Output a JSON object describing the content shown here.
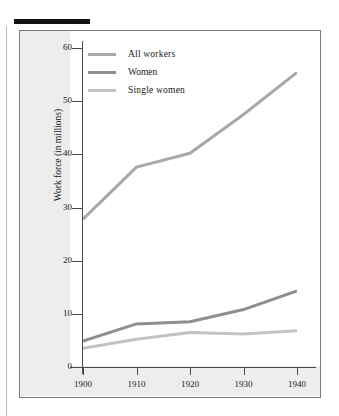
{
  "figure": {
    "y_axis_title": "Work force (in millions)"
  },
  "chart_data": {
    "type": "line",
    "title": "",
    "xlabel": "",
    "ylabel": "Work force (in millions)",
    "categories": [
      "1900",
      "1910",
      "1920",
      "1930",
      "1940"
    ],
    "x": [
      1900,
      1910,
      1920,
      1930,
      1940
    ],
    "xlim": [
      1900,
      1940
    ],
    "ylim": [
      0,
      62
    ],
    "yticks": [
      0,
      10,
      20,
      30,
      40,
      50,
      60
    ],
    "ytick_labels": [
      "0",
      "10",
      "20",
      "30",
      "40",
      "50",
      "60"
    ],
    "xtick_labels": [
      "1900",
      "1910",
      "1920",
      "1930",
      "1940"
    ],
    "grid": false,
    "legend_position": "top-left",
    "series": [
      {
        "name": "All workers",
        "color": "#a8a8a8",
        "width": 3,
        "values": [
          27.8,
          37.6,
          40.2,
          47.5,
          55.4
        ]
      },
      {
        "name": "Women",
        "color": "#8e8e8e",
        "width": 3,
        "values": [
          4.9,
          8.1,
          8.5,
          10.8,
          14.3
        ]
      },
      {
        "name": "Single women",
        "color": "#c2c2c2",
        "width": 3,
        "values": [
          3.5,
          5.2,
          6.5,
          6.2,
          6.8
        ]
      }
    ]
  }
}
